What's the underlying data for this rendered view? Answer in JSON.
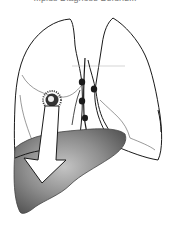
{
  "figure": {
    "caption_partial": "...plus Diagnose Befund...",
    "labels": {
      "right_lung": "right lung",
      "left_lung": "left lung",
      "lesion": "primary tumor",
      "lymph_nodes": "mediastinal lymph nodes",
      "liver": "liver",
      "arrow": "metastatic spread arrow"
    },
    "colors": {
      "outline": "#1a1a1a",
      "thin_line": "#555555",
      "liver_dark": "#5a5a5a",
      "liver_light": "#b8b8b8",
      "arrow_fill": "#ffffff",
      "node": "#1a1a1a"
    }
  }
}
